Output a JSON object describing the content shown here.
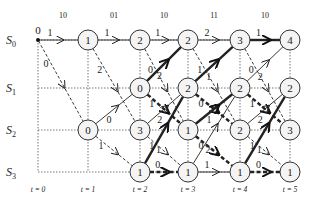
{
  "received_bits": [
    "10",
    "01",
    "10",
    "11",
    "10"
  ],
  "states": [
    "S0",
    "S1",
    "S2",
    "S3"
  ],
  "time_labels": [
    "t = 0",
    "t = 1",
    "t = 2",
    "t = 3",
    "t = 4",
    "t = 5"
  ],
  "geometry": {
    "cols": [
      38,
      88,
      140,
      188,
      240,
      290
    ],
    "rows": [
      40,
      88,
      130,
      172
    ],
    "node_r": 10
  },
  "nodes": [
    {
      "t": 0,
      "s": 0,
      "metric": "0",
      "start": true
    },
    {
      "t": 1,
      "s": 0,
      "metric": "1"
    },
    {
      "t": 1,
      "s": 2,
      "metric": "0"
    },
    {
      "t": 2,
      "s": 0,
      "metric": "2"
    },
    {
      "t": 2,
      "s": 1,
      "metric": "0"
    },
    {
      "t": 2,
      "s": 2,
      "metric": "3"
    },
    {
      "t": 2,
      "s": 3,
      "metric": "1"
    },
    {
      "t": 3,
      "s": 0,
      "metric": "2"
    },
    {
      "t": 3,
      "s": 1,
      "metric": "2"
    },
    {
      "t": 3,
      "s": 2,
      "metric": "1"
    },
    {
      "t": 3,
      "s": 3,
      "metric": "1"
    },
    {
      "t": 4,
      "s": 0,
      "metric": "3"
    },
    {
      "t": 4,
      "s": 1,
      "metric": "2"
    },
    {
      "t": 4,
      "s": 2,
      "metric": "2"
    },
    {
      "t": 4,
      "s": 3,
      "metric": "1"
    },
    {
      "t": 5,
      "s": 0,
      "metric": "4"
    },
    {
      "t": 5,
      "s": 1,
      "metric": "2"
    },
    {
      "t": 5,
      "s": 2,
      "metric": "3"
    },
    {
      "t": 5,
      "s": 3,
      "metric": "1"
    }
  ],
  "branches": [
    {
      "from": [
        0,
        0
      ],
      "to": [
        1,
        0
      ],
      "label": "1",
      "style": "solid"
    },
    {
      "from": [
        0,
        0
      ],
      "to": [
        1,
        2
      ],
      "label": "0",
      "style": "dashed"
    },
    {
      "from": [
        1,
        0
      ],
      "to": [
        2,
        0
      ],
      "label": "1",
      "style": "solid"
    },
    {
      "from": [
        1,
        0
      ],
      "to": [
        2,
        2
      ],
      "label": "2",
      "style": "dashed"
    },
    {
      "from": [
        1,
        2
      ],
      "to": [
        2,
        1
      ],
      "label": "0",
      "style": "solid"
    },
    {
      "from": [
        1,
        2
      ],
      "to": [
        2,
        3
      ],
      "label": "1",
      "style": "dashed"
    },
    {
      "from": [
        2,
        0
      ],
      "to": [
        3,
        0
      ],
      "label": "1",
      "style": "solid"
    },
    {
      "from": [
        2,
        0
      ],
      "to": [
        3,
        2
      ],
      "label": "0",
      "style": "dashed"
    },
    {
      "from": [
        2,
        1
      ],
      "to": [
        3,
        0
      ],
      "label": "2",
      "style": "bold"
    },
    {
      "from": [
        2,
        1
      ],
      "to": [
        3,
        2
      ],
      "label": "1",
      "style": "bold-dashed"
    },
    {
      "from": [
        2,
        2
      ],
      "to": [
        3,
        1
      ],
      "label": "2",
      "style": "solid"
    },
    {
      "from": [
        2,
        2
      ],
      "to": [
        3,
        3
      ],
      "label": "1",
      "style": "dashed"
    },
    {
      "from": [
        2,
        3
      ],
      "to": [
        3,
        1
      ],
      "label": "1",
      "style": "bold"
    },
    {
      "from": [
        2,
        3
      ],
      "to": [
        3,
        3
      ],
      "label": "0",
      "style": "bold-dashed"
    },
    {
      "from": [
        3,
        0
      ],
      "to": [
        4,
        0
      ],
      "label": "2",
      "style": "solid"
    },
    {
      "from": [
        3,
        0
      ],
      "to": [
        4,
        2
      ],
      "label": "1",
      "style": "dashed"
    },
    {
      "from": [
        3,
        1
      ],
      "to": [
        4,
        0
      ],
      "label": "1",
      "style": "bold"
    },
    {
      "from": [
        3,
        1
      ],
      "to": [
        4,
        2
      ],
      "label": "0",
      "style": "bold-dashed"
    },
    {
      "from": [
        3,
        2
      ],
      "to": [
        4,
        1
      ],
      "label": "1",
      "style": "bold"
    },
    {
      "from": [
        3,
        2
      ],
      "to": [
        4,
        3
      ],
      "label": "0",
      "style": "bold-dashed"
    },
    {
      "from": [
        3,
        3
      ],
      "to": [
        4,
        1
      ],
      "label": "2",
      "style": "solid"
    },
    {
      "from": [
        3,
        3
      ],
      "to": [
        4,
        3
      ],
      "label": "1",
      "style": "solid"
    },
    {
      "from": [
        4,
        0
      ],
      "to": [
        5,
        0
      ],
      "label": "1",
      "style": "bold"
    },
    {
      "from": [
        4,
        0
      ],
      "to": [
        5,
        2
      ],
      "label": "0",
      "style": "dashed"
    },
    {
      "from": [
        4,
        1
      ],
      "to": [
        5,
        0
      ],
      "label": "2",
      "style": "solid"
    },
    {
      "from": [
        4,
        1
      ],
      "to": [
        5,
        2
      ],
      "label": "1",
      "style": "bold-dashed"
    },
    {
      "from": [
        4,
        2
      ],
      "to": [
        5,
        1
      ],
      "label": "2",
      "style": "solid"
    },
    {
      "from": [
        4,
        2
      ],
      "to": [
        5,
        3
      ],
      "label": "1",
      "style": "dashed"
    },
    {
      "from": [
        4,
        3
      ],
      "to": [
        5,
        1
      ],
      "label": "1",
      "style": "bold"
    },
    {
      "from": [
        4,
        3
      ],
      "to": [
        5,
        3
      ],
      "label": "0",
      "style": "bold-dashed"
    }
  ],
  "colors": {
    "line": "#222222",
    "grid": "#555555",
    "node_fill": "#f4f4f4"
  }
}
